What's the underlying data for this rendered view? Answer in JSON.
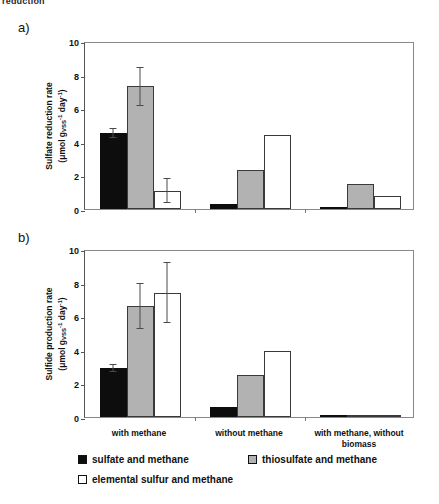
{
  "clipped_header_text": "reduction",
  "panels": [
    {
      "letter": "a)",
      "ylabel_line1": "Sulfate reduction rate",
      "ylabel_line2_prefix": "(μmol g",
      "ylabel_sub": "VSS",
      "ylabel_sup1": "-1",
      "ylabel_mid": " day",
      "ylabel_sup2": "-1",
      "ylabel_suffix": ")"
    },
    {
      "letter": "b)",
      "ylabel_line1": "Sulfide production rate",
      "ylabel_line2_prefix": "(μmol g",
      "ylabel_sub": "VSS",
      "ylabel_sup1": "-1",
      "ylabel_mid": " day",
      "ylabel_sup2": "-1",
      "ylabel_suffix": ")"
    }
  ],
  "yticks": [
    "10",
    "8",
    "6",
    "4",
    "2",
    "0"
  ],
  "categories": [
    "with methane",
    "without methane",
    "with methane, without biomass"
  ],
  "legend": [
    {
      "swatch": "black",
      "label": "sulfate and methane"
    },
    {
      "swatch": "gray",
      "label": "thiosulfate and methane"
    },
    {
      "swatch": "white",
      "label": "elemental sulfur and methane"
    }
  ],
  "colors": {
    "sulfate_and_methane": "#0d0d0d",
    "thiosulfate_and_methane": "#b2b2b2",
    "elemental_sulfur_and_methane": "#ffffff",
    "axis": "#888888",
    "error_bar": "#4a4a4a"
  },
  "chart_data": [
    {
      "type": "bar",
      "panel": "a",
      "title": "Sulfate reduction rate",
      "xlabel": "",
      "ylabel": "Sulfate reduction rate (μmol g_VSS^-1 day^-1)",
      "ylim": [
        0,
        10
      ],
      "yticks": [
        0,
        2,
        4,
        6,
        8,
        10
      ],
      "grid": false,
      "legend_position": "below-figure",
      "categories": [
        "with methane",
        "without methane",
        "with methane, without biomass"
      ],
      "series": [
        {
          "name": "sulfate and methane",
          "values": [
            4.55,
            0.3,
            0.1
          ],
          "errors": [
            0.3,
            0,
            0
          ]
        },
        {
          "name": "thiosulfate and methane",
          "values": [
            7.3,
            2.3,
            1.5
          ],
          "errors": [
            1.15,
            0,
            0
          ]
        },
        {
          "name": "elemental sulfur and methane",
          "values": [
            1.1,
            4.4,
            0.75
          ],
          "errors": [
            0.75,
            0,
            0
          ]
        }
      ]
    },
    {
      "type": "bar",
      "panel": "b",
      "title": "Sulfide production rate",
      "xlabel": "",
      "ylabel": "Sulfide production rate (μmol g_VSS^-1 day^-1)",
      "ylim": [
        0,
        10
      ],
      "yticks": [
        0,
        2,
        4,
        6,
        8,
        10
      ],
      "grid": false,
      "legend_position": "below-figure",
      "categories": [
        "with methane",
        "without methane",
        "with methane, without biomass"
      ],
      "series": [
        {
          "name": "sulfate and methane",
          "values": [
            2.9,
            0.6,
            0.0
          ],
          "errors": [
            0.25,
            0,
            0
          ]
        },
        {
          "name": "thiosulfate and methane",
          "values": [
            6.6,
            2.5,
            0.05
          ],
          "errors": [
            1.35,
            0,
            0
          ]
        },
        {
          "name": "elemental sulfur and methane",
          "values": [
            7.4,
            3.95,
            0.1
          ],
          "errors": [
            1.8,
            0,
            0
          ]
        }
      ]
    }
  ]
}
